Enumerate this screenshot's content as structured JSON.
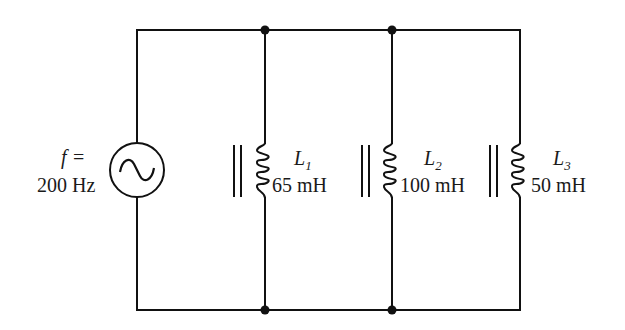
{
  "diagram": {
    "type": "parallel-inductor-circuit",
    "source": {
      "symbol": "ac-voltage-source",
      "label_var": "f",
      "label_eq": "=",
      "frequency": "200 Hz"
    },
    "inductors": [
      {
        "name": "L",
        "subscript": "1",
        "value": "65 mH",
        "core": "iron-core"
      },
      {
        "name": "L",
        "subscript": "2",
        "value": "100 mH",
        "core": "iron-core"
      },
      {
        "name": "L",
        "subscript": "3",
        "value": "50 mH",
        "core": "iron-core"
      }
    ],
    "junctions": 4,
    "colors": {
      "wire": "#111111",
      "background": "#ffffff"
    }
  }
}
